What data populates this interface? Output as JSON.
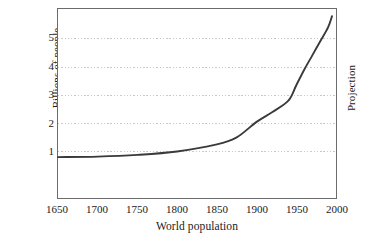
{
  "chart_data": {
    "type": "line",
    "title": "",
    "xlabel": "World population",
    "ylabel": "Billions of people",
    "xlim": [
      1650,
      2000
    ],
    "ylim": [
      0,
      5.8
    ],
    "grid": true,
    "grid_axis": "y",
    "legend": "none",
    "annotations": [
      {
        "text": "Projection",
        "position": "right-outside",
        "rotation": -90
      }
    ],
    "xticks": [
      1650,
      1700,
      1750,
      1800,
      1850,
      1900,
      1950,
      2000
    ],
    "xtick_labels": [
      "1650",
      "1700",
      "1750",
      "1800",
      "1850",
      "1900",
      "1950",
      "2000"
    ],
    "yticks": [
      1,
      2,
      3,
      4,
      5
    ],
    "ytick_labels": [
      "1",
      "2",
      "3",
      "4",
      "5"
    ],
    "series": [
      {
        "name": "World population",
        "color": "#3a3a3a",
        "x": [
          1650,
          1700,
          1750,
          1800,
          1850,
          1875,
          1900,
          1920,
          1940,
          1950,
          1960,
          1970,
          1980,
          1990,
          1995
        ],
        "values": [
          0.8,
          0.82,
          0.88,
          1.0,
          1.25,
          1.5,
          2.05,
          2.4,
          2.8,
          3.35,
          3.9,
          4.4,
          4.9,
          5.4,
          5.8
        ]
      }
    ]
  },
  "axes": {
    "y_label": "Billions of people",
    "x_label": "World population",
    "y_ticks": [
      "1",
      "2",
      "3",
      "4",
      "5"
    ],
    "x_ticks": [
      "1650",
      "1700",
      "1750",
      "1800",
      "1850",
      "1900",
      "1950",
      "2000"
    ]
  },
  "annotation": {
    "projection": "Projection"
  },
  "colors": {
    "frame": "#6b6b6b",
    "gridline": "#c9c9c9",
    "curve": "#3a3a3a",
    "background": "#ffffff",
    "text": "#1a1a1a"
  }
}
